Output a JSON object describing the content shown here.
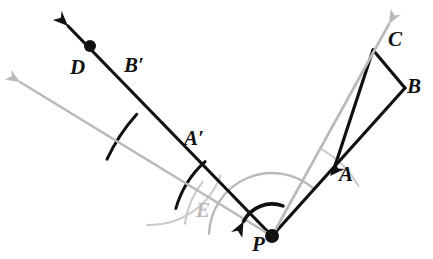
{
  "figure": {
    "kind": "geometry-diagram",
    "width": 433,
    "height": 259,
    "background_color": "#ffffff"
  },
  "colors": {
    "stroke_primary": "#111111",
    "stroke_secondary": "#b9b9b9",
    "label_primary": "#111111",
    "label_secondary": "#b9b9b9",
    "background": "#ffffff"
  },
  "labels": [
    {
      "id": "label-D",
      "text": "D",
      "x": 70,
      "y": 57,
      "color": "#111111",
      "tone": "dark"
    },
    {
      "id": "label-Bp",
      "text": "B′",
      "x": 124,
      "y": 55,
      "color": "#111111",
      "tone": "dark"
    },
    {
      "id": "label-Ap",
      "text": "A′",
      "x": 184,
      "y": 128,
      "color": "#111111",
      "tone": "dark"
    },
    {
      "id": "label-E",
      "text": "E",
      "x": 196,
      "y": 200,
      "color": "#b9b9b9",
      "tone": "gray"
    },
    {
      "id": "label-P",
      "text": "P",
      "x": 252,
      "y": 234,
      "color": "#111111",
      "tone": "dark"
    },
    {
      "id": "label-A",
      "text": "A",
      "x": 339,
      "y": 164,
      "color": "#111111",
      "tone": "dark"
    },
    {
      "id": "label-C",
      "text": "C",
      "x": 388,
      "y": 29,
      "color": "#111111",
      "tone": "dark"
    },
    {
      "id": "label-B",
      "text": "B",
      "x": 407,
      "y": 76,
      "color": "#111111",
      "tone": "dark"
    }
  ],
  "points": [
    {
      "id": "point-P",
      "name": "P",
      "x": 272,
      "y": 236,
      "marker": "filled-dot",
      "radius": 7,
      "color": "#111111"
    },
    {
      "id": "point-D",
      "name": "D",
      "x": 90,
      "y": 46,
      "marker": "filled-dot",
      "radius": 6,
      "color": "#111111"
    },
    {
      "id": "point-A",
      "name": "A",
      "x": 333,
      "y": 172,
      "marker": "vertex",
      "color": "#111111"
    },
    {
      "id": "point-C",
      "name": "C",
      "x": 373,
      "y": 50,
      "marker": "vertex",
      "color": "#111111"
    },
    {
      "id": "point-B",
      "name": "B",
      "x": 405,
      "y": 88,
      "marker": "vertex",
      "color": "#111111"
    }
  ],
  "segments": [
    {
      "id": "seg-PA-B",
      "name": "ray-P-through-A-to-B",
      "x1": 272,
      "y1": 236,
      "x2": 405,
      "y2": 88,
      "color": "#111111",
      "width": 3.2
    },
    {
      "id": "seg-CB",
      "name": "edge-C-to-B",
      "x1": 373,
      "y1": 50,
      "x2": 405,
      "y2": 88,
      "color": "#111111",
      "width": 3.2
    },
    {
      "id": "seg-AC",
      "name": "edge-A-to-C",
      "x1": 333,
      "y1": 172,
      "x2": 373,
      "y2": 50,
      "color": "#111111",
      "width": 3.2
    },
    {
      "id": "seg-PD",
      "name": "ray-P-to-D-image",
      "x1": 272,
      "y1": 236,
      "x2": 68,
      "y2": 26,
      "color": "#111111",
      "width": 3.2
    },
    {
      "id": "seg-PE",
      "name": "ray-P-to-E-gray",
      "x1": 272,
      "y1": 236,
      "x2": 20,
      "y2": 82,
      "color": "#b9b9b9",
      "width": 2.6
    },
    {
      "id": "seg-PC",
      "name": "ray-P-to-C-gray",
      "x1": 272,
      "y1": 236,
      "x2": 389,
      "y2": 24,
      "color": "#b9b9b9",
      "width": 2.6
    }
  ],
  "arrows": [
    {
      "id": "arrow-D-tip",
      "name": "arrowhead-ray-PD",
      "x": 68,
      "y": 26,
      "angle_deg": 224.0,
      "color": "#111111",
      "size": 15
    },
    {
      "id": "arrow-E-tip",
      "name": "arrowhead-ray-PE",
      "x": 20,
      "y": 82,
      "angle_deg": 211.4,
      "color": "#b9b9b9",
      "size": 14
    },
    {
      "id": "arrow-C-tip",
      "name": "arrowhead-ray-PC",
      "x": 389,
      "y": 24,
      "angle_deg": -61.1,
      "color": "#b9b9b9",
      "size": 14
    },
    {
      "id": "arrow-A-mid",
      "name": "arrowhead-ray-PA",
      "x": 330,
      "y": 176,
      "angle_deg": -48.1,
      "color": "#111111",
      "size": 15
    }
  ],
  "arcs": [
    {
      "id": "arc-rotation-big",
      "name": "rotation-angle-arc",
      "cx": 272,
      "cy": 236,
      "r": 63,
      "start_deg": 182,
      "end_deg": 312,
      "color": "#b9b9b9",
      "width": 2.4
    },
    {
      "id": "arc-tick-Ap",
      "name": "congruence-arc-A-prime",
      "cx": 272,
      "cy": 236,
      "r": 100,
      "start_deg": 196,
      "end_deg": 228,
      "color": "#111111",
      "width": 3.0
    },
    {
      "id": "arc-tick-Bp",
      "name": "congruence-arc-B-prime",
      "cx": 272,
      "cy": 236,
      "r": 182,
      "start_deg": 205,
      "end_deg": 222,
      "color": "#111111",
      "width": 3.0
    },
    {
      "id": "arc-compass-E1",
      "name": "compass-arc-E-near",
      "cx": 272,
      "cy": 236,
      "r": 88,
      "start_deg": 188,
      "end_deg": 218,
      "color": "#cccccc",
      "width": 2.2
    },
    {
      "id": "arc-compass-E2",
      "name": "compass-arc-E-far",
      "cx": 150,
      "cy": 150,
      "r": 75,
      "start_deg": 20,
      "end_deg": 92,
      "color": "#cccccc",
      "width": 2.2
    },
    {
      "id": "arc-compass-A",
      "name": "compass-arc-A-side",
      "cx": 272,
      "cy": 236,
      "r": 100,
      "start_deg": 300,
      "end_deg": 330,
      "color": "#cccccc",
      "width": 2.2
    }
  ],
  "rotation_indicator": {
    "id": "arrow-rotation-direction",
    "name": "rotation-direction-arrow",
    "description": "curved black arrow at P indicating counterclockwise rotation",
    "cx": 272,
    "cy": 236,
    "r": 32,
    "start_deg": 290,
    "end_deg": 207,
    "head_angle_deg": 207,
    "color": "#111111",
    "width": 3.6,
    "head_size": 15
  }
}
